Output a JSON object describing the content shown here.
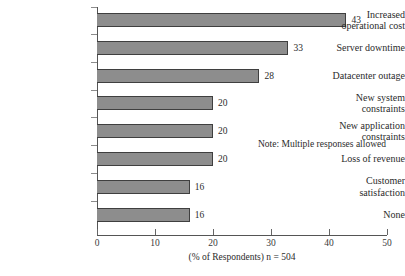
{
  "chart_data": {
    "type": "bar",
    "orientation": "horizontal",
    "title": "",
    "clipped_title_fragment": "",
    "categories": [
      "Increased\noperational cost",
      "Server downtime",
      "Datacenter outage",
      "New system\nconstraints",
      "New application\nconstraints",
      "Loss of revenue",
      "Customer\nsatisfaction",
      "None"
    ],
    "values": [
      43,
      33,
      28,
      20,
      20,
      20,
      16,
      16
    ],
    "value_labels": [
      "43",
      "33",
      "28",
      "20",
      "20",
      "20",
      "16",
      "16"
    ],
    "xlabel": "(% of Respondents) n = 504",
    "ylabel": "",
    "xlim": [
      0,
      50
    ],
    "xticks": [
      0,
      10,
      20,
      30,
      40,
      50
    ],
    "xtick_labels": [
      "0",
      "10",
      "20",
      "30",
      "40",
      "50"
    ],
    "grid": false,
    "legend": false,
    "annotations": [
      "Note: Multiple responses allowed"
    ],
    "bar_color": "#8d8d8d",
    "bar_border_color": "#3f3f3f",
    "axis_color": "#555555",
    "background": "#ffffff"
  },
  "note": "Note: Multiple responses allowed"
}
